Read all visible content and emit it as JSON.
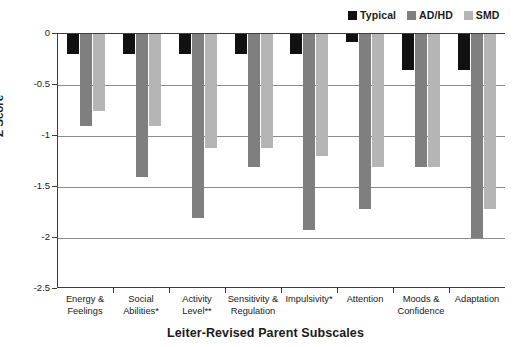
{
  "chart_data": {
    "type": "bar",
    "title": "",
    "xlabel": "Leiter-Revised Parent Subscales",
    "ylabel": "Z Score",
    "ylim": [
      -2.5,
      0
    ],
    "yticks": [
      0,
      -0.5,
      -1,
      -1.5,
      -2,
      -2.5
    ],
    "ytick_labels": [
      "0",
      "-0.5",
      "-1",
      "-1.5",
      "-2",
      "-2.5"
    ],
    "grid": true,
    "legend_position": "top-right",
    "categories": [
      "Energy & Feelings",
      "Social Abilities*",
      "Activity Level**",
      "Sensitivity & Regulation",
      "Impulsivity*",
      "Attention",
      "Moods & Confidence",
      "Adaptation"
    ],
    "category_lines": [
      [
        "Energy &",
        "Feelings"
      ],
      [
        "Social",
        "Abilities*"
      ],
      [
        "Activity",
        "Level**"
      ],
      [
        "Sensitivity &",
        "Regulation"
      ],
      [
        "Impulsivity*"
      ],
      [
        "Attention"
      ],
      [
        "Moods &",
        "Confidence"
      ],
      [
        "Adaptation"
      ]
    ],
    "series": [
      {
        "name": "Typical",
        "color": "#111111",
        "values": [
          -0.2,
          -0.2,
          -0.2,
          -0.2,
          -0.2,
          -0.08,
          -0.35,
          -0.35
        ]
      },
      {
        "name": "AD/HD",
        "color": "#7f7f7f",
        "values": [
          -0.9,
          -1.4,
          -1.8,
          -1.3,
          -1.92,
          -1.72,
          -1.3,
          -2.0
        ]
      },
      {
        "name": "SMD",
        "color": "#b5b5b5",
        "values": [
          -0.75,
          -0.9,
          -1.12,
          -1.12,
          -1.2,
          -1.3,
          -1.3,
          -1.72
        ]
      }
    ]
  },
  "legend": {
    "items": [
      {
        "label": "Typical",
        "color": "#111111"
      },
      {
        "label": "AD/HD",
        "color": "#7f7f7f"
      },
      {
        "label": "SMD",
        "color": "#b5b5b5"
      }
    ]
  },
  "axes": {
    "y_title": "Z Score",
    "x_title": "Leiter-Revised Parent Subscales"
  }
}
